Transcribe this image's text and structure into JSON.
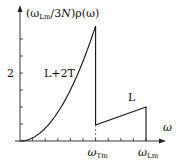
{
  "chart_data": {
    "type": "line",
    "title": "",
    "xlabel": "ω",
    "ylabel": "(ω_Lm/3N)ρ(ω)",
    "ylabel_parts": {
      "open": "(ω",
      "sub1": "Lm",
      "mid": "/3",
      "italicN": "N",
      "close": ")ρ(ω)"
    },
    "y_ticks": [
      0.5,
      1.0,
      1.5,
      2.0,
      2.5,
      3.0
    ],
    "y_tick_labels": [
      {
        "value": 2,
        "label": "2"
      }
    ],
    "x_ticks_count": 10,
    "x_tick_labels": [
      {
        "label": "ω",
        "sub": "Tm",
        "x": 0.6
      },
      {
        "label": "ω",
        "sub": "Lm",
        "x": 1.0
      }
    ],
    "xlim": [
      0,
      1.0
    ],
    "ylim": [
      0,
      3.5
    ],
    "grid": false,
    "legend": null,
    "annotations": [
      {
        "text": "L+2T",
        "x": 0.35,
        "y": 2.0
      },
      {
        "text": "L",
        "x": 0.85,
        "y": 1.2
      }
    ],
    "series": [
      {
        "name": "L+2T",
        "description": "quadratic rise from 0 to peak at ω_Tm",
        "x": [
          0,
          0.1,
          0.2,
          0.3,
          0.4,
          0.5,
          0.6
        ],
        "values": [
          0,
          0.09,
          0.38,
          0.85,
          1.5,
          2.35,
          3.38
        ]
      },
      {
        "name": "drop",
        "x": [
          0.6,
          0.6
        ],
        "values": [
          3.38,
          0.47
        ]
      },
      {
        "name": "L",
        "description": "linear rise from ω_Tm to ω_Lm then drop to 0",
        "x": [
          0.6,
          1.0,
          1.0
        ],
        "values": [
          0.47,
          1.0,
          0
        ]
      }
    ],
    "vertical_dashed_at": 0.6
  }
}
